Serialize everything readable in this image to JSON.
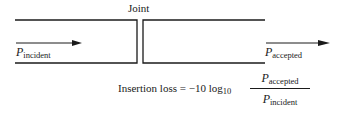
{
  "diagram": {
    "joint_label": "Joint",
    "incident": {
      "symbol": "P",
      "subscript": "incident"
    },
    "accepted": {
      "symbol": "P",
      "subscript": "accepted"
    },
    "formula": {
      "lhs": "Insertion loss = −10 log",
      "log_base": "10",
      "numerator": {
        "symbol": "P",
        "subscript": "accepted"
      },
      "denominator": {
        "symbol": "P",
        "subscript": "incident"
      }
    },
    "colors": {
      "line": "#1a1a1a",
      "background": "#ffffff"
    }
  }
}
